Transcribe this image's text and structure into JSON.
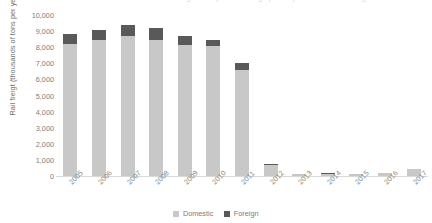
{
  "chart_data": {
    "type": "bar",
    "subtype": "stacked-vertical",
    "title": "Rail freight transported through ports by domestic and foreign",
    "xlabel": "",
    "ylabel": "Rail freigt (thousands of tons per year)",
    "ylim": [
      0,
      10000
    ],
    "ytick_step": 1000,
    "grid": false,
    "legend_position": "bottom-center",
    "categories": [
      "2005",
      "2006",
      "2007",
      "2008",
      "2009",
      "2010",
      "2011",
      "2012",
      "2013",
      "2014",
      "2015",
      "2016",
      "2017"
    ],
    "ytick_labels": [
      "10,000",
      "9,000",
      "8,000",
      "7,000",
      "6,000",
      "5,000",
      "4,000",
      "3,000",
      "2,000",
      "1,000",
      "0"
    ],
    "ytick_values": [
      10000,
      9000,
      8000,
      7000,
      6000,
      5000,
      4000,
      3000,
      2000,
      1000,
      0
    ],
    "series": [
      {
        "name": "Domestic",
        "color": "#c8c8c8",
        "values": [
          8200,
          8450,
          8700,
          8450,
          8140,
          8070,
          6580,
          700,
          120,
          150,
          140,
          200,
          420
        ]
      },
      {
        "name": "Foreign",
        "color": "#595959",
        "values": [
          620,
          620,
          680,
          740,
          560,
          380,
          440,
          60,
          0,
          20,
          0,
          0,
          0
        ]
      }
    ],
    "totals": [
      8820,
      9070,
      9380,
      9190,
      8700,
      8450,
      7020,
      760,
      120,
      170,
      140,
      200,
      420
    ]
  },
  "legend": {
    "items": [
      {
        "label": "Domestic",
        "color": "#c8c8c8"
      },
      {
        "label": "Foreign",
        "color": "#595959"
      }
    ]
  }
}
